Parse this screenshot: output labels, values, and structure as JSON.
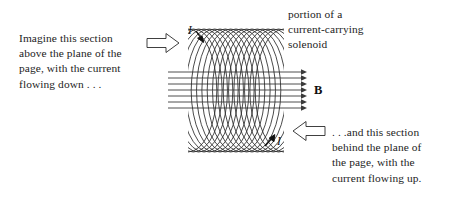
{
  "figure": {
    "background_color": "#ffffff",
    "ink_color": "#1a1a1a"
  },
  "captions": {
    "left": "Imagine this section\nabove the plane of the\npage, with the current\nflowing down . . .",
    "top_right": "portion of a\ncurrent-carrying\nsolenoid",
    "bottom_right": ". . .and this section\nbehind the plane of\nthe page, with the\ncurrent flowing up."
  },
  "labels": {
    "current_top": "I",
    "current_bottom": "I",
    "field": "B"
  },
  "diagram": {
    "coil": {
      "left_x": 188,
      "right_x": 284,
      "top_y": 29,
      "bottom_y": 152,
      "turns": 19,
      "stroke_color": "#2b2b2b"
    },
    "field_lines": {
      "count": 7,
      "start_x": 168,
      "end_x": 306,
      "top_y": 72,
      "bottom_y": 108,
      "arrow_direction": "right",
      "stroke_color": "#3a3a3a"
    },
    "block_arrows": [
      {
        "name": "left-block-arrow",
        "direction": "right",
        "x": 147,
        "y": 43
      },
      {
        "name": "right-block-arrow",
        "direction": "left",
        "x": 292,
        "y": 131
      }
    ],
    "current_arrows": [
      {
        "name": "top-current-arrow",
        "direction": "down-left",
        "x": 198,
        "y": 34
      },
      {
        "name": "bottom-current-arrow",
        "direction": "up-right",
        "x": 272,
        "y": 140
      }
    ]
  }
}
